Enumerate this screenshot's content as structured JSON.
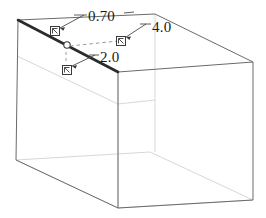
{
  "drawing": {
    "type": "wireframe-isometric-box",
    "background_color": "#ffffff",
    "stroke_color": "#5a5a5a",
    "hidden_stroke_color": "#c9c9c9",
    "highlight_stroke_color": "#2b2b2b",
    "leader_color": "#4a4a4a",
    "text_color": "#1a1a1a"
  },
  "dimensions": [
    {
      "id": "thickness",
      "label": "0.70",
      "marker": "pick-square-icon",
      "marker_x": 55,
      "marker_y": 31,
      "leader_from_x": 63,
      "leader_from_y": 30,
      "leader_to_x": 86,
      "leader_to_y": 15,
      "text_x": 88,
      "text_y": 21
    },
    {
      "id": "length",
      "label": "4.0",
      "marker": "pick-square-icon",
      "marker_x": 120,
      "marker_y": 39,
      "leader_from_x": 127,
      "leader_from_y": 39,
      "leader_to_x": 146,
      "leader_to_y": 24,
      "text_x": 152,
      "text_y": 33
    },
    {
      "id": "width",
      "label": "2.0",
      "marker": "pick-square-icon",
      "marker_x": 66,
      "marker_y": 68,
      "leader_from_x": 74,
      "leader_from_y": 68,
      "leader_to_x": 96,
      "leader_to_y": 55,
      "text_x": 100,
      "text_y": 62
    }
  ],
  "vertex_marker": {
    "id": "selected-vertex",
    "shape": "circle",
    "x": 67,
    "y": 45,
    "radius": 3
  },
  "geometry": {
    "top_near_left": [
      18,
      20
    ],
    "top_near_right": [
      118,
      72
    ],
    "top_far_left": [
      155,
      14
    ],
    "top_far_right": [
      253,
      62
    ],
    "bottom_near_left": [
      16,
      160
    ],
    "bottom_near_right": [
      118,
      208
    ],
    "bottom_far_right": [
      253,
      200
    ]
  }
}
